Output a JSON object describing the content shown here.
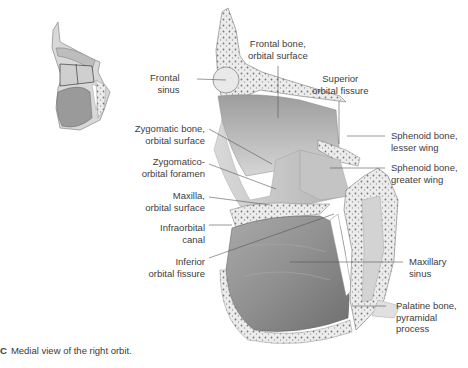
{
  "figure": {
    "letter": "C",
    "caption": "Medial view of the right orbit."
  },
  "labels": {
    "frontal_sinus": [
      "Frontal",
      "sinus"
    ],
    "frontal_bone_orbital": [
      "Frontal bone,",
      "orbital surface"
    ],
    "superior_orbital_fissure": [
      "Superior",
      "orbital fissure"
    ],
    "sphenoid_lesser_wing": [
      "Sphenoid bone,",
      "lesser wing"
    ],
    "sphenoid_greater_wing": [
      "Sphenoid bone,",
      "greater wing"
    ],
    "zygomatic_orbital": [
      "Zygomatic bone,",
      "orbital surface"
    ],
    "zygomatico_orbital_foramen": [
      "Zygomatico-",
      "orbital foramen"
    ],
    "maxilla_orbital": [
      "Maxilla,",
      "orbital surface"
    ],
    "infraorbital_canal": [
      "Infraorbital",
      "canal"
    ],
    "inferior_orbital_fissure": [
      "Inferior",
      "orbital fissure"
    ],
    "maxillary_sinus": [
      "Maxillary",
      "sinus"
    ],
    "palatine_pyramidal": [
      "Palatine bone,",
      "pyramidal",
      "process"
    ]
  },
  "colors": {
    "bone_light": "#e6e6e6",
    "bone_mid": "#bdbdbd",
    "bone_dark": "#8a8a8a",
    "leader": "#555555",
    "text": "#3d3d3d"
  }
}
